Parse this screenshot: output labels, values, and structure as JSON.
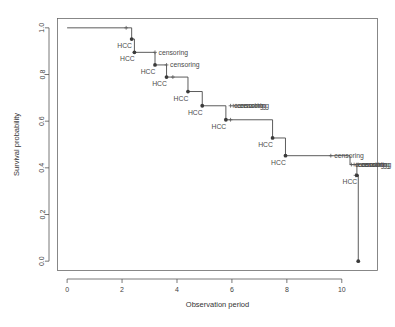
{
  "chart_data": {
    "type": "line",
    "subtype": "kaplan-meier-step",
    "title": "",
    "xlabel": "Observation period",
    "ylabel": "Survival probability",
    "xlim": [
      -0.35,
      11.3
    ],
    "ylim": [
      -0.04,
      1.04
    ],
    "xticks": [
      0,
      2,
      4,
      6,
      8,
      10
    ],
    "xtick_labels": [
      "0",
      "2",
      "4",
      "6",
      "8",
      "10"
    ],
    "yticks": [
      0.0,
      0.2,
      0.4,
      0.6,
      0.8,
      1.0
    ],
    "ytick_labels": [
      "0.0",
      "0.2",
      "0.4",
      "0.6",
      "0.8",
      "1.0"
    ],
    "grid": false,
    "legend": "none",
    "line_color": "#4a4a4a",
    "marker_color": "#3a3a3a",
    "step_points": [
      {
        "x": 0.0,
        "y": 1.0
      },
      {
        "x": 2.35,
        "y": 1.0
      },
      {
        "x": 2.35,
        "y": 0.952
      },
      {
        "x": 2.45,
        "y": 0.952
      },
      {
        "x": 2.45,
        "y": 0.895
      },
      {
        "x": 3.2,
        "y": 0.895
      },
      {
        "x": 3.2,
        "y": 0.841
      },
      {
        "x": 3.62,
        "y": 0.841
      },
      {
        "x": 3.62,
        "y": 0.789
      },
      {
        "x": 4.4,
        "y": 0.789
      },
      {
        "x": 4.4,
        "y": 0.727
      },
      {
        "x": 4.92,
        "y": 0.727
      },
      {
        "x": 4.92,
        "y": 0.666
      },
      {
        "x": 5.78,
        "y": 0.666
      },
      {
        "x": 5.78,
        "y": 0.606
      },
      {
        "x": 7.48,
        "y": 0.606
      },
      {
        "x": 7.48,
        "y": 0.528
      },
      {
        "x": 7.95,
        "y": 0.528
      },
      {
        "x": 7.95,
        "y": 0.452
      },
      {
        "x": 10.3,
        "y": 0.452
      },
      {
        "x": 10.3,
        "y": 0.414
      },
      {
        "x": 10.55,
        "y": 0.414
      },
      {
        "x": 10.55,
        "y": 0.368
      },
      {
        "x": 10.6,
        "y": 0.368
      },
      {
        "x": 10.6,
        "y": 0.0
      }
    ],
    "events": [
      {
        "x": 2.35,
        "y": 0.952,
        "label": "HCC"
      },
      {
        "x": 2.45,
        "y": 0.895,
        "label": "HCC"
      },
      {
        "x": 3.2,
        "y": 0.841,
        "label": "HCC"
      },
      {
        "x": 3.62,
        "y": 0.789,
        "label": "HCC"
      },
      {
        "x": 4.4,
        "y": 0.727,
        "label": "HCC"
      },
      {
        "x": 4.92,
        "y": 0.666,
        "label": "HCC"
      },
      {
        "x": 5.78,
        "y": 0.606,
        "label": "HCC"
      },
      {
        "x": 7.48,
        "y": 0.528,
        "label": "HCC"
      },
      {
        "x": 7.95,
        "y": 0.452,
        "label": "HCC"
      },
      {
        "x": 10.55,
        "y": 0.368,
        "label": "HCC"
      },
      {
        "x": 10.6,
        "y": 0.0,
        "label": ""
      }
    ],
    "censorings": [
      {
        "x": 2.15,
        "y": 1.0,
        "label": "censoring",
        "label_shown": false
      },
      {
        "x": 3.2,
        "y": 0.895,
        "label": "censoring",
        "label_shown": true
      },
      {
        "x": 3.62,
        "y": 0.841,
        "label": "censoring",
        "label_shown": true
      },
      {
        "x": 3.85,
        "y": 0.789,
        "label": "censoring",
        "label_shown": false
      },
      {
        "x": 5.95,
        "y": 0.666,
        "label": "censoring",
        "label_shown": true
      },
      {
        "x": 6.05,
        "y": 0.666,
        "label": "censoring",
        "label_shown": true
      },
      {
        "x": 6.15,
        "y": 0.666,
        "label": "censoring",
        "label_shown": true
      },
      {
        "x": 5.95,
        "y": 0.606,
        "label": "censoring",
        "label_shown": false
      },
      {
        "x": 9.6,
        "y": 0.452,
        "label": "censoring",
        "label_shown": true
      },
      {
        "x": 10.35,
        "y": 0.414,
        "label": "censoring",
        "label_shown": true
      },
      {
        "x": 10.45,
        "y": 0.414,
        "label": "censoring",
        "label_shown": true
      },
      {
        "x": 10.55,
        "y": 0.414,
        "label": "censoring",
        "label_shown": true
      },
      {
        "x": 10.6,
        "y": 0.414,
        "label": "censoring",
        "label_shown": true
      },
      {
        "x": 10.5,
        "y": 0.368,
        "label": "censoring",
        "label_shown": false
      }
    ],
    "event_label_text": "HCC",
    "censor_label_text": "censoring"
  }
}
